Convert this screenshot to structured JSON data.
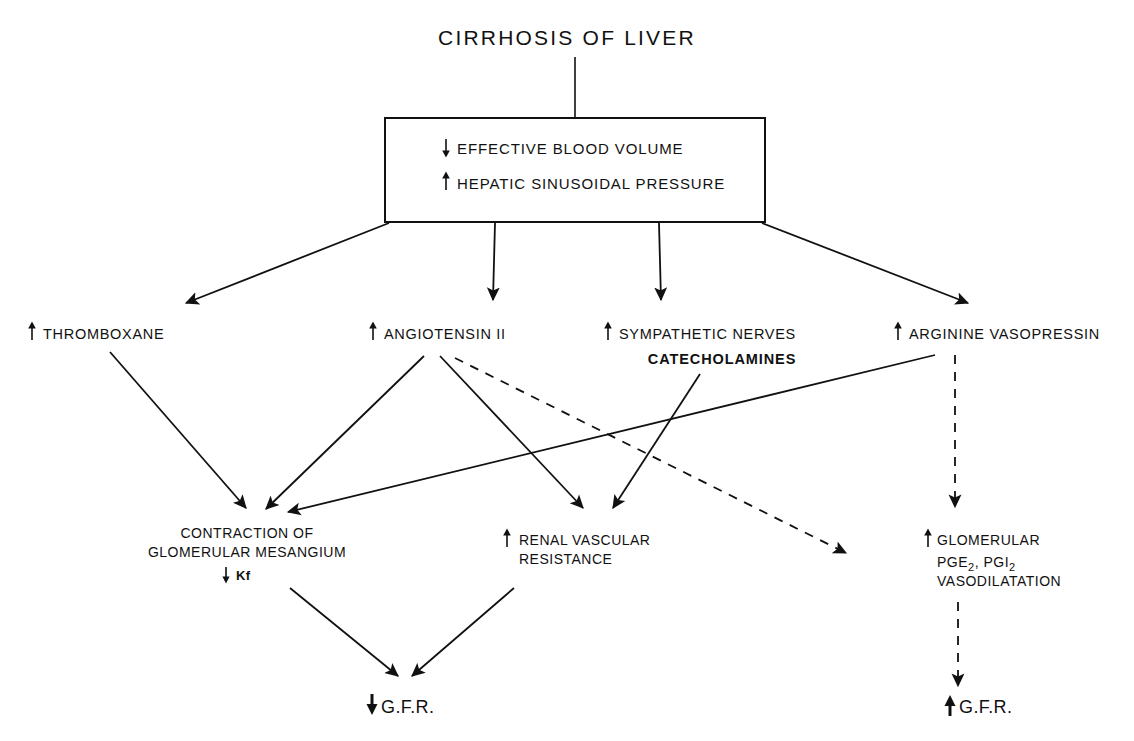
{
  "diagram": {
    "title": "CIRRHOSIS OF LIVER",
    "root_box": {
      "line1_arrow": "down",
      "line1": "EFFECTIVE BLOOD VOLUME",
      "line2_arrow": "up",
      "line2": "HEPATIC SINUSOIDAL PRESSURE"
    },
    "mediators": [
      {
        "arrow": "up",
        "label": "THROMBOXANE"
      },
      {
        "arrow": "up",
        "label": "ANGIOTENSIN II"
      },
      {
        "arrow": "up",
        "label": "SYMPATHETIC NERVES",
        "sublabel": "CATECHOLAMINES"
      },
      {
        "arrow": "up",
        "label": "ARGININE VASOPRESSIN"
      }
    ],
    "effects": {
      "mesangium": {
        "line1": "CONTRACTION OF",
        "line2": "GLOMERULAR MESANGIUM",
        "line3_arrow": "down",
        "line3": "Kf"
      },
      "resistance": {
        "arrow": "up",
        "line1": "RENAL VASCULAR",
        "line2": "RESISTANCE"
      },
      "prostaglandin": {
        "arrow": "up",
        "line1": "GLOMERULAR",
        "line2_a": "PGE",
        "line2_sub_a": "2",
        "line2_b": ", PGI",
        "line2_sub_b": "2",
        "line3": "VASODILATATION"
      }
    },
    "outcomes": [
      {
        "arrow": "down",
        "label": "G.F.R."
      },
      {
        "arrow": "up",
        "label": "G.F.R."
      }
    ],
    "colors": {
      "ink": "#111111",
      "paper": "#ffffff"
    }
  }
}
